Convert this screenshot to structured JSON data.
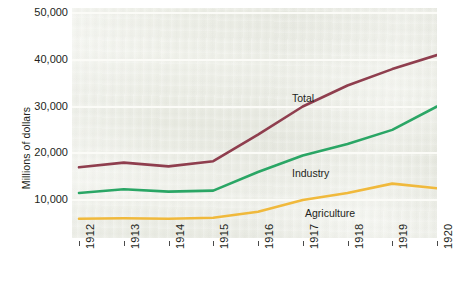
{
  "chart_data": {
    "type": "line",
    "title": "",
    "subtitle": "",
    "xlabel": "",
    "ylabel": "Millions of dollars",
    "x": [
      "1912",
      "1913",
      "1914",
      "1915",
      "1916",
      "1917",
      "1918",
      "1919",
      "1920"
    ],
    "categories": [
      "1912",
      "1913",
      "1914",
      "1915",
      "1916",
      "1917",
      "1918",
      "1919",
      "1920"
    ],
    "ylim": [
      0,
      50000
    ],
    "xlim": [
      "1912",
      "1920"
    ],
    "y_ticks": [
      10000,
      20000,
      30000,
      40000,
      50000
    ],
    "y_tick_labels": [
      "10,000",
      "20,000",
      "30,000",
      "40,000",
      "50,000"
    ],
    "grid": true,
    "legend_position": "inline-labels",
    "series": [
      {
        "name": "Total",
        "color": "#8f3e4e",
        "values": [
          17000,
          18000,
          17200,
          18300,
          24000,
          30000,
          34500,
          38000,
          41000
        ]
      },
      {
        "name": "Industry",
        "color": "#2aa665",
        "values": [
          11500,
          12300,
          11800,
          12000,
          16000,
          19500,
          22000,
          25000,
          30000
        ]
      },
      {
        "name": "Agriculture",
        "color": "#f0b93c",
        "values": [
          6000,
          6100,
          6000,
          6200,
          7500,
          10000,
          11500,
          13500,
          12500
        ]
      }
    ],
    "annotations": [
      {
        "text": "Total",
        "series": "Total",
        "x_px": 292,
        "y_px": 92
      },
      {
        "text": "Industry",
        "series": "Industry",
        "x_px": 292,
        "y_px": 167
      },
      {
        "text": "Agriculture",
        "series": "Agriculture",
        "x_px": 305,
        "y_px": 207
      }
    ],
    "colors": {
      "plot_background": "#eceee5",
      "page_background": "#ffffff",
      "gridline": "#fbfbf7",
      "text": "#231f20",
      "total": "#8f3e4e",
      "industry": "#2aa665",
      "agriculture": "#f0b93c"
    }
  }
}
